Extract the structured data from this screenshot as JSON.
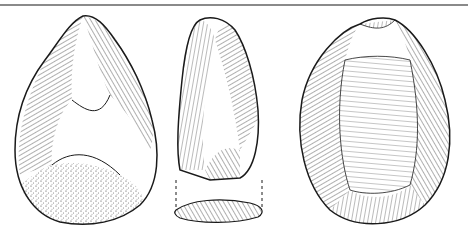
{
  "figure": {
    "views": [
      {
        "name": "front-view",
        "label": "Hand-axe face with stippled cortex base"
      },
      {
        "name": "side-view",
        "label": "Hand-axe profile with cross-section below"
      },
      {
        "name": "back-view",
        "label": "Hand-axe reverse face"
      }
    ],
    "colors": {
      "ink": "#1a1a1a",
      "rule": "#8a8a8a",
      "background": "#ffffff"
    }
  }
}
